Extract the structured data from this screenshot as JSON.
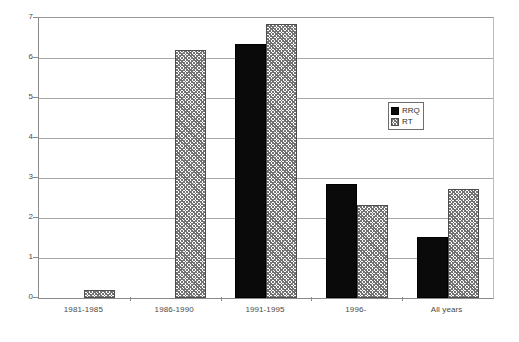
{
  "chart_data": {
    "type": "bar",
    "title": "",
    "subtitle": "",
    "xlabel": "",
    "ylabel": "",
    "categories": [
      "1981-1985",
      "1986-1990",
      "1991-1995",
      "1996-",
      "All years"
    ],
    "series": [
      {
        "name": "RRQ",
        "values": [
          0,
          0,
          6.35,
          2.85,
          1.53
        ],
        "color": "#0a0a0a",
        "fill": "solid"
      },
      {
        "name": "RT",
        "values": [
          0.2,
          6.2,
          6.85,
          2.33,
          2.72
        ],
        "color": "#6f6f6f",
        "fill": "crosshatch"
      }
    ],
    "ylim": [
      0,
      7
    ],
    "ytick_labels": [
      "0",
      "1",
      "2",
      "3",
      "4",
      "5",
      "6",
      "7"
    ],
    "ytick_values": [
      0,
      1,
      2,
      3,
      4,
      5,
      6,
      7
    ],
    "grid": true,
    "grid_axis": "y",
    "legend": {
      "position": "upper-center-right",
      "entries": [
        {
          "label": "RRQ",
          "fill": "solid"
        },
        {
          "label": "RT",
          "fill": "crosshatch"
        }
      ]
    },
    "frame": true,
    "background": "#ffffff"
  }
}
